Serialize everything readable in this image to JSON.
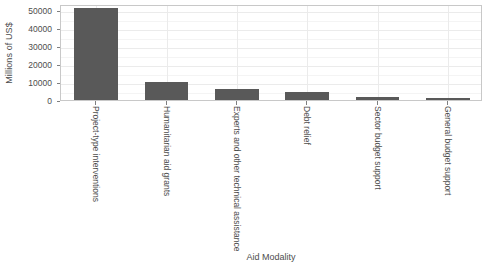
{
  "chart_data": {
    "type": "bar",
    "title": "",
    "xlabel": "Aid Modality",
    "ylabel": "Millions of US$",
    "categories": [
      "Project-type interventions",
      "Humanitarian aid grants",
      "Experts and other technical assistance",
      "Debt relief",
      "Sector budget support",
      "General budget support"
    ],
    "values": [
      51500,
      9800,
      6000,
      4300,
      1700,
      1400
    ],
    "ylim": [
      0,
      53500
    ],
    "yticks": [
      0,
      10000,
      20000,
      30000,
      40000,
      50000
    ],
    "yticklabels": [
      "0",
      "10000",
      "20000",
      "30000",
      "40000",
      "50000"
    ],
    "grid": true,
    "legend": false,
    "bar_color": "#595959",
    "panel_background": "#ffffff",
    "grid_color": "#ebebeb",
    "text_color": "#4d4d4d",
    "axis_line_color": "#c8c8c8"
  }
}
